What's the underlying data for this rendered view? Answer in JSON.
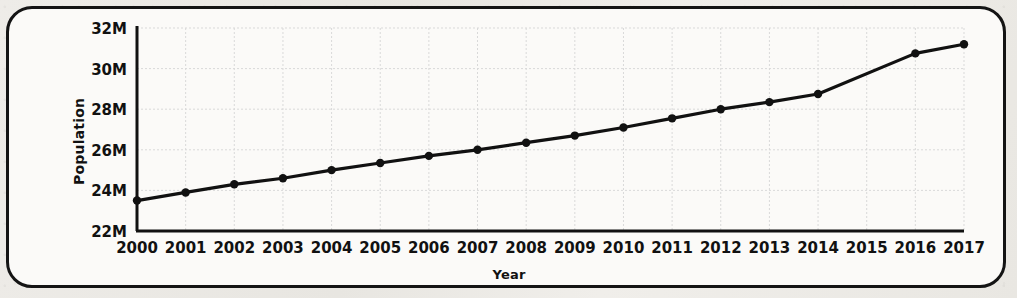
{
  "figure": {
    "frame_color": "#141414",
    "paper_background": "#eceae6",
    "plot_background": "#fbfaf8"
  },
  "chart_data": {
    "type": "line",
    "title": "",
    "xlabel": "Year",
    "ylabel": "Population",
    "x": [
      2000,
      2001,
      2002,
      2003,
      2004,
      2005,
      2006,
      2007,
      2008,
      2009,
      2010,
      2011,
      2012,
      2013,
      2014,
      2016,
      2017
    ],
    "values": [
      23.5,
      23.9,
      24.3,
      24.6,
      25.0,
      25.35,
      25.7,
      26.0,
      26.35,
      26.7,
      27.1,
      27.55,
      28.0,
      28.35,
      28.75,
      30.75,
      31.2
    ],
    "value_unit": "millions",
    "series": [
      {
        "name": "Population",
        "color": "#111111",
        "marker": "circle",
        "values": [
          23.5,
          23.9,
          24.3,
          24.6,
          25.0,
          25.35,
          25.7,
          26.0,
          26.35,
          26.7,
          27.1,
          27.55,
          28.0,
          28.35,
          28.75,
          30.75,
          31.2
        ]
      }
    ],
    "xtick_labels": [
      "2000",
      "2001",
      "2002",
      "2003",
      "2004",
      "2005",
      "2006",
      "2007",
      "2008",
      "2009",
      "2010",
      "2011",
      "2012",
      "2013",
      "2014",
      "2015",
      "2016",
      "2017"
    ],
    "xtick_values": [
      2000,
      2001,
      2002,
      2003,
      2004,
      2005,
      2006,
      2007,
      2008,
      2009,
      2010,
      2011,
      2012,
      2013,
      2014,
      2015,
      2016,
      2017
    ],
    "ytick_labels": [
      "22M",
      "24M",
      "26M",
      "28M",
      "30M",
      "32M"
    ],
    "ytick_values": [
      22,
      24,
      26,
      28,
      30,
      32
    ],
    "xlim": [
      2000,
      2017
    ],
    "ylim": [
      22,
      32
    ],
    "grid": true,
    "grid_color": "#d9d9d9",
    "legend": false,
    "legend_position": "none"
  }
}
